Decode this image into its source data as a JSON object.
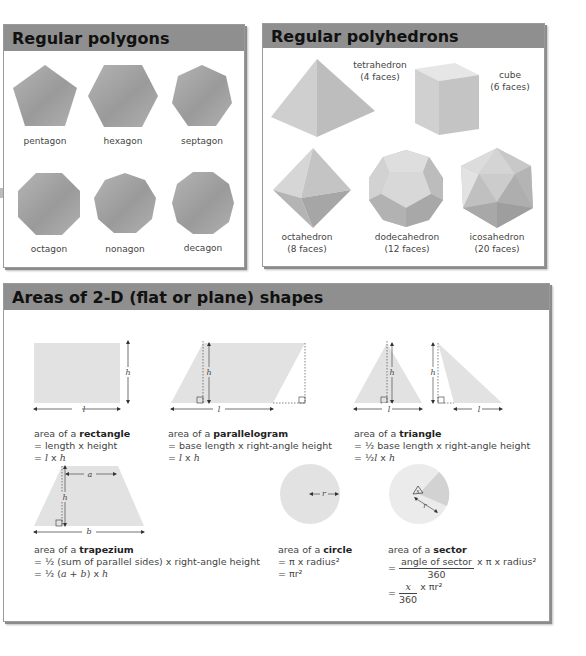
{
  "polygons": {
    "title": "Regular polygons",
    "items": [
      {
        "name": "pentagon",
        "sides": 5
      },
      {
        "name": "hexagon",
        "sides": 6
      },
      {
        "name": "septagon",
        "sides": 7
      },
      {
        "name": "octagon",
        "sides": 8
      },
      {
        "name": "nonagon",
        "sides": 9
      },
      {
        "name": "decagon",
        "sides": 10
      }
    ]
  },
  "polyhedrons": {
    "title": "Regular polyhedrons",
    "items": [
      {
        "name": "tetrahedron",
        "faces": "(4 faces)"
      },
      {
        "name": "cube",
        "faces": "(6 faces)"
      },
      {
        "name": "octahedron",
        "faces": "(8 faces)"
      },
      {
        "name": "dodecahedron",
        "faces": "(12 faces)"
      },
      {
        "name": "icosahedron",
        "faces": "(20 faces)"
      }
    ]
  },
  "areas": {
    "title": "Areas of 2-D (flat or plane) shapes",
    "prefix": "area of a ",
    "rectangle": {
      "name": "rectangle",
      "line1": "= length x height",
      "line2_pre": "= ",
      "l": "l",
      "x": " x ",
      "h": "h",
      "dim_l": "l",
      "dim_h": "h"
    },
    "parallelogram": {
      "name": "parallelogram",
      "line1": "= base length x right-angle height",
      "line2_pre": "= ",
      "l": "l",
      "x": " x ",
      "h": "h",
      "dim_l": "l",
      "dim_h": "h"
    },
    "triangle": {
      "name": "triangle",
      "line1": "= ½ base length x right-angle height",
      "line2_pre": "= ½",
      "l": "l",
      "x": " x ",
      "h": "h",
      "dim_l": "l",
      "dim_h": "h"
    },
    "trapezium": {
      "name": "trapezium",
      "line1": "= ½ (sum of parallel sides) x right-angle height",
      "line2_pre": "= ½ (",
      "a": "a",
      "plus": " + ",
      "b": "b",
      "line2_post": ") x ",
      "h": "h",
      "dim_a": "a",
      "dim_b": "b",
      "dim_h": "h"
    },
    "circle": {
      "name": "circle",
      "line1": "= π x radius²",
      "line2": "= πr²",
      "dim_r": "r"
    },
    "sector": {
      "name": "sector",
      "line1_num": "angle of sector",
      "line1_den": "360",
      "line1_post": " x π x radius²",
      "line2_pre": "= ",
      "line2_num": "x",
      "line2_den": "360",
      "line2_post": " x πr²",
      "dim_r": "r",
      "dim_x": "x"
    }
  },
  "colors": {
    "header_bg": "#8f8f8f",
    "shape_gray": "#a6a6a6",
    "flat_shape": "#e2e2e2"
  }
}
